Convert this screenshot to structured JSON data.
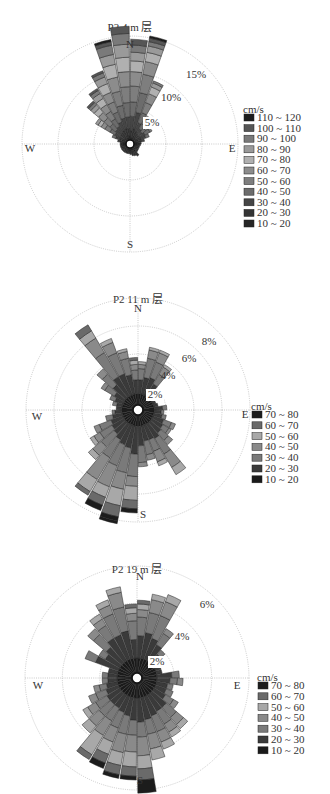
{
  "chart_data": [
    {
      "type": "rose",
      "title": "P2 4 m 层",
      "directions": [
        "N",
        "E",
        "S",
        "W"
      ],
      "ring_labels": [
        "5%",
        "10%",
        "15%"
      ],
      "rings": [
        5,
        10,
        15
      ],
      "rmax": 15,
      "legend_title": "cm/s",
      "bins": [
        "110 ~ 120",
        "100 ~ 110",
        "90 ~ 100",
        "80 ~ 90",
        "70 ~ 80",
        "60 ~ 70",
        "50 ~ 60",
        "40 ~ 50",
        "30 ~ 40",
        "20 ~ 30",
        "10 ~ 20"
      ],
      "bin_colors": [
        "#1c1c1c",
        "#565656",
        "#7a7a7a",
        "#9a9a9a",
        "#b0b0b0",
        "#8c8c8c",
        "#7e7e7e",
        "#6c6c6c",
        "#454545",
        "#343434",
        "#262626"
      ],
      "sector_width_deg": 10,
      "sectors": [
        {
          "dir": 5,
          "stack": [
            0.3,
            1.0,
            2.0,
            2.0,
            2.2,
            2.0,
            1.5,
            1.2,
            1.0,
            0.8
          ]
        },
        {
          "dir": 15,
          "stack": [
            0.4,
            1.2,
            2.3,
            2.8,
            2.6,
            1.8,
            1.3,
            0.9,
            0.6,
            0.5,
            0.3
          ]
        },
        {
          "dir": 25,
          "stack": [
            0.5,
            0.8,
            1.3,
            1.5,
            1.5,
            1.3,
            1.0,
            0.6,
            0.3
          ]
        },
        {
          "dir": 35,
          "stack": [
            0.5,
            0.6,
            0.8,
            0.8,
            0.6,
            0.4,
            0.3
          ]
        },
        {
          "dir": 45,
          "stack": [
            0.5,
            0.6,
            0.6,
            0.6,
            0.4
          ]
        },
        {
          "dir": 55,
          "stack": [
            0.5,
            0.6,
            0.8,
            0.8,
            0.3
          ]
        },
        {
          "dir": 65,
          "stack": [
            0.5,
            0.6,
            0.7,
            0.5
          ]
        },
        {
          "dir": 75,
          "stack": [
            0.5,
            0.5,
            0.5
          ]
        },
        {
          "dir": 85,
          "stack": [
            0.5,
            0.5
          ]
        },
        {
          "dir": 95,
          "stack": [
            0.5,
            0.4
          ]
        },
        {
          "dir": 105,
          "stack": [
            0.5,
            0.3
          ]
        },
        {
          "dir": 115,
          "stack": [
            0.5,
            0.3
          ]
        },
        {
          "dir": 125,
          "stack": [
            0.5,
            0.3
          ]
        },
        {
          "dir": 135,
          "stack": [
            0.5,
            0.4
          ]
        },
        {
          "dir": 145,
          "stack": [
            0.6,
            0.8
          ]
        },
        {
          "dir": 155,
          "stack": [
            0.6,
            0.6
          ]
        },
        {
          "dir": 165,
          "stack": [
            0.6,
            0.5
          ]
        },
        {
          "dir": 175,
          "stack": [
            0.5,
            0.4
          ]
        },
        {
          "dir": 185,
          "stack": [
            0.5,
            0.3
          ]
        },
        {
          "dir": 195,
          "stack": [
            0.5,
            0.3
          ]
        },
        {
          "dir": 205,
          "stack": [
            0.5,
            0.3
          ]
        },
        {
          "dir": 215,
          "stack": [
            0.5,
            0.3
          ]
        },
        {
          "dir": 225,
          "stack": [
            0.5,
            0.3
          ]
        },
        {
          "dir": 235,
          "stack": [
            0.5,
            0.3
          ]
        },
        {
          "dir": 245,
          "stack": [
            0.5,
            0.3
          ]
        },
        {
          "dir": 255,
          "stack": [
            0.5,
            0.3
          ]
        },
        {
          "dir": 265,
          "stack": [
            0.5,
            0.3
          ]
        },
        {
          "dir": 275,
          "stack": [
            0.5,
            0.3
          ]
        },
        {
          "dir": 285,
          "stack": [
            0.5,
            0.4,
            0.3
          ]
        },
        {
          "dir": 295,
          "stack": [
            0.5,
            0.5,
            0.6,
            0.5
          ]
        },
        {
          "dir": 305,
          "stack": [
            0.5,
            0.6,
            0.8,
            0.8,
            0.8,
            0.6,
            0.5,
            0.4
          ]
        },
        {
          "dir": 315,
          "stack": [
            0.5,
            0.7,
            0.9,
            1.0,
            1.1,
            1.0,
            0.8,
            0.6,
            0.4,
            0.3
          ]
        },
        {
          "dir": 325,
          "stack": [
            0.5,
            0.8,
            1.0,
            1.2,
            1.2,
            1.1,
            1.0,
            0.8,
            0.5,
            0.3
          ]
        },
        {
          "dir": 335,
          "stack": [
            0.6,
            0.9,
            1.2,
            1.5,
            1.5,
            1.4,
            1.3,
            1.0,
            0.6,
            0.3
          ]
        },
        {
          "dir": 345,
          "stack": [
            0.6,
            1.0,
            1.5,
            1.8,
            2.0,
            2.0,
            1.8,
            1.4,
            1.3,
            0.5,
            0.3
          ]
        },
        {
          "dir": 355,
          "stack": [
            0.6,
            1.0,
            1.6,
            2.0,
            2.2,
            2.1,
            2.0,
            1.8,
            1.5,
            1.0
          ]
        }
      ]
    },
    {
      "type": "rose",
      "title": "P2 11 m 层",
      "directions": [
        "N",
        "E",
        "S",
        "W"
      ],
      "ring_labels": [
        "2%",
        "4%",
        "6%",
        "8%"
      ],
      "rings": [
        2,
        4,
        6,
        8
      ],
      "rmax": 8,
      "legend_title": "cm/s",
      "bins": [
        "70 ~ 80",
        "60 ~ 70",
        "50 ~ 60",
        "40 ~ 50",
        "30 ~ 40",
        "20 ~ 30",
        "10 ~ 20"
      ],
      "bin_colors": [
        "#1c1c1c",
        "#6a6a6a",
        "#a8a8a8",
        "#8a8a8a",
        "#7a7a7a",
        "#3a3a3a",
        "#1a1a1a"
      ],
      "sector_width_deg": 10,
      "sectors": [
        {
          "dir": 5,
          "stack": [
            0.8,
            1.0,
            0.8,
            0.3,
            0.2
          ]
        },
        {
          "dir": 15,
          "stack": [
            0.8,
            1.2,
            1.4,
            0.6,
            0.2
          ]
        },
        {
          "dir": 25,
          "stack": [
            0.8,
            1.3,
            1.2,
            0.7,
            0.2
          ]
        },
        {
          "dir": 35,
          "stack": [
            0.8,
            1.0,
            0.8,
            0.6,
            0.2
          ]
        },
        {
          "dir": 45,
          "stack": [
            0.8,
            0.4
          ]
        },
        {
          "dir": 55,
          "stack": [
            0.8,
            0.2
          ]
        },
        {
          "dir": 65,
          "stack": [
            0.8,
            0.2
          ]
        },
        {
          "dir": 75,
          "stack": [
            0.8,
            0.3
          ]
        },
        {
          "dir": 85,
          "stack": [
            0.8,
            0.6,
            0.3
          ]
        },
        {
          "dir": 95,
          "stack": [
            0.8,
            0.5,
            0.2
          ]
        },
        {
          "dir": 105,
          "stack": [
            0.8,
            0.6,
            0.3
          ]
        },
        {
          "dir": 115,
          "stack": [
            0.8,
            0.8,
            0.6,
            0.3
          ]
        },
        {
          "dir": 125,
          "stack": [
            0.8,
            0.9,
            0.5,
            0.2
          ]
        },
        {
          "dir": 135,
          "stack": [
            0.8,
            1.0,
            0.7,
            0.4
          ]
        },
        {
          "dir": 145,
          "stack": [
            0.8,
            1.2,
            1.3,
            1.1,
            0.6
          ]
        },
        {
          "dir": 155,
          "stack": [
            0.8,
            1.1,
            0.9,
            0.8,
            0.3
          ]
        },
        {
          "dir": 165,
          "stack": [
            0.8,
            1.1,
            1.0,
            0.4
          ]
        },
        {
          "dir": 175,
          "stack": [
            0.8,
            1.4,
            1.2,
            0.3
          ]
        },
        {
          "dir": 185,
          "stack": [
            0.8,
            2.0,
            1.6,
            0.7,
            1.0,
            0.6,
            0.3
          ]
        },
        {
          "dir": 195,
          "stack": [
            0.8,
            1.6,
            1.8,
            1.2,
            1.2,
            0.8,
            0.3,
            0.2
          ]
        },
        {
          "dir": 205,
          "stack": [
            0.8,
            1.5,
            1.6,
            1.6,
            0.8,
            0.6,
            0.4
          ]
        },
        {
          "dir": 215,
          "stack": [
            0.8,
            1.3,
            1.5,
            1.8,
            1.0,
            0.3
          ]
        },
        {
          "dir": 225,
          "stack": [
            0.8,
            1.1,
            1.2,
            0.8,
            0.4
          ]
        },
        {
          "dir": 235,
          "stack": [
            0.8,
            1.0,
            1.0,
            0.5,
            0.3
          ]
        },
        {
          "dir": 245,
          "stack": [
            0.8,
            0.9,
            0.9,
            0.4
          ]
        },
        {
          "dir": 255,
          "stack": [
            0.8,
            0.7,
            0.5
          ]
        },
        {
          "dir": 265,
          "stack": [
            0.8,
            0.5,
            0.2
          ]
        },
        {
          "dir": 275,
          "stack": [
            0.8,
            0.4
          ]
        },
        {
          "dir": 285,
          "stack": [
            0.8,
            0.4,
            0.3
          ]
        },
        {
          "dir": 295,
          "stack": [
            0.8,
            0.6,
            0.4
          ]
        },
        {
          "dir": 305,
          "stack": [
            0.8,
            0.8,
            0.8,
            0.3
          ]
        },
        {
          "dir": 315,
          "stack": [
            0.8,
            1.2,
            1.0,
            0.5
          ]
        },
        {
          "dir": 325,
          "stack": [
            0.8,
            1.6,
            2.0,
            1.2,
            0.6,
            0.5
          ]
        },
        {
          "dir": 335,
          "stack": [
            0.8,
            1.6,
            1.6,
            0.8,
            0.3
          ]
        },
        {
          "dir": 345,
          "stack": [
            0.8,
            1.4,
            1.2,
            0.5,
            0.2
          ]
        },
        {
          "dir": 355,
          "stack": [
            0.8,
            1.0,
            0.7,
            0.4,
            0.3,
            0.2
          ]
        }
      ]
    },
    {
      "type": "rose",
      "title": "P2 19 m 层",
      "directions": [
        "N",
        "E",
        "S",
        "W"
      ],
      "ring_labels": [
        "2%",
        "4%",
        "6%"
      ],
      "rings": [
        2,
        4,
        6
      ],
      "rmax": 6,
      "legend_title": "cm/s",
      "bins": [
        "70 ~ 80",
        "60 ~ 70",
        "50 ~ 60",
        "40 ~ 50",
        "30 ~ 40",
        "20 ~ 30",
        "10 ~ 20"
      ],
      "bin_colors": [
        "#1c1c1c",
        "#6a6a6a",
        "#a8a8a8",
        "#8a8a8a",
        "#7a7a7a",
        "#3a3a3a",
        "#1a1a1a"
      ],
      "sector_width_deg": 10,
      "sectors": [
        {
          "dir": 5,
          "stack": [
            0.8,
            1.2,
            1.0,
            0.4,
            0.3,
            0.2
          ]
        },
        {
          "dir": 15,
          "stack": [
            0.8,
            1.4,
            1.1,
            0.7,
            0.3
          ]
        },
        {
          "dir": 25,
          "stack": [
            0.8,
            1.2,
            1.3,
            0.8,
            0.4
          ]
        },
        {
          "dir": 35,
          "stack": [
            0.8,
            1.0,
            0.7,
            0.3
          ]
        },
        {
          "dir": 45,
          "stack": [
            0.8,
            0.6,
            0.3
          ]
        },
        {
          "dir": 55,
          "stack": [
            0.8,
            0.4
          ]
        },
        {
          "dir": 65,
          "stack": [
            0.8,
            0.3
          ]
        },
        {
          "dir": 75,
          "stack": [
            0.8,
            0.3
          ]
        },
        {
          "dir": 85,
          "stack": [
            0.8,
            0.8,
            0.4
          ]
        },
        {
          "dir": 95,
          "stack": [
            0.8,
            0.7,
            0.4,
            0.3
          ]
        },
        {
          "dir": 105,
          "stack": [
            0.8,
            0.6,
            0.3
          ]
        },
        {
          "dir": 115,
          "stack": [
            0.8,
            0.6,
            0.4
          ]
        },
        {
          "dir": 125,
          "stack": [
            0.8,
            0.7,
            0.5,
            0.3
          ]
        },
        {
          "dir": 135,
          "stack": [
            0.8,
            1.0,
            0.7,
            0.5,
            0.3
          ]
        },
        {
          "dir": 145,
          "stack": [
            0.8,
            1.0,
            0.8,
            0.5,
            0.3
          ]
        },
        {
          "dir": 155,
          "stack": [
            0.8,
            1.1,
            0.9,
            0.6,
            0.4
          ]
        },
        {
          "dir": 165,
          "stack": [
            0.8,
            1.2,
            0.8,
            0.8,
            0.6
          ]
        },
        {
          "dir": 175,
          "stack": [
            0.8,
            1.3,
            0.8,
            1.0,
            0.7,
            0.6,
            0.7
          ]
        },
        {
          "dir": 185,
          "stack": [
            0.8,
            1.2,
            0.8,
            0.9,
            0.8,
            0.5,
            0.2
          ]
        },
        {
          "dir": 195,
          "stack": [
            0.8,
            1.0,
            1.0,
            1.0,
            0.7,
            0.5,
            0.2
          ]
        },
        {
          "dir": 205,
          "stack": [
            0.8,
            0.9,
            0.9,
            0.8,
            0.7,
            0.5,
            0.3
          ]
        },
        {
          "dir": 215,
          "stack": [
            0.8,
            0.8,
            0.8,
            0.9,
            1.2,
            0.3
          ]
        },
        {
          "dir": 225,
          "stack": [
            0.8,
            0.8,
            0.8,
            0.7,
            0.5
          ]
        },
        {
          "dir": 235,
          "stack": [
            0.8,
            0.8,
            0.7,
            0.5,
            0.3
          ]
        },
        {
          "dir": 245,
          "stack": [
            0.8,
            0.7,
            0.6,
            0.4
          ]
        },
        {
          "dir": 255,
          "stack": [
            0.8,
            0.6,
            0.4,
            0.3
          ]
        },
        {
          "dir": 265,
          "stack": [
            0.8,
            0.5,
            0.3
          ]
        },
        {
          "dir": 275,
          "stack": [
            0.8,
            0.5,
            0.3
          ]
        },
        {
          "dir": 285,
          "stack": [
            0.8,
            0.5
          ]
        },
        {
          "dir": 295,
          "stack": [
            0.8,
            1.3,
            0.6
          ]
        },
        {
          "dir": 305,
          "stack": [
            0.8,
            0.9,
            0.4
          ]
        },
        {
          "dir": 315,
          "stack": [
            0.8,
            1.1,
            0.9,
            0.4
          ]
        },
        {
          "dir": 325,
          "stack": [
            0.8,
            1.4,
            0.8,
            0.4,
            0.3
          ]
        },
        {
          "dir": 335,
          "stack": [
            0.8,
            1.4,
            1.2,
            0.5,
            0.3
          ]
        },
        {
          "dir": 345,
          "stack": [
            0.8,
            1.5,
            1.3,
            0.8,
            0.3
          ]
        },
        {
          "dir": 355,
          "stack": [
            0.8,
            1.0,
            1.0,
            0.4,
            0.3,
            0.2
          ]
        }
      ]
    }
  ]
}
